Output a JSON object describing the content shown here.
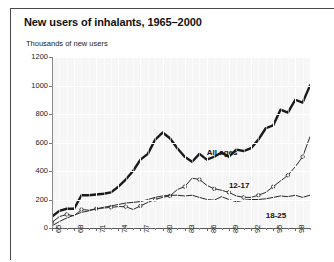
{
  "figure": {
    "title": "New users of inhalants, 1965–2000",
    "ylabel": "Thousands of new users"
  },
  "chart_data": {
    "type": "line",
    "title": "New users of inhalants, 1965–2000",
    "subtitle": "",
    "xlabel": "",
    "ylabel": "Thousands of new users",
    "ylim": [
      0,
      1200
    ],
    "yticks": [
      0,
      200,
      400,
      600,
      800,
      1000,
      1200
    ],
    "ytick_labels": [
      "0",
      "200",
      "400",
      "600",
      "800",
      "1000",
      "1200"
    ],
    "xlim": [
      1965,
      2000
    ],
    "xticks": [
      1965,
      1968,
      1971,
      1974,
      1977,
      1980,
      1983,
      1986,
      1989,
      1992,
      1995,
      1998
    ],
    "xtick_labels": [
      "65",
      "68",
      "71",
      "74",
      "77",
      "80",
      "83",
      "86",
      "89",
      "92",
      "95",
      "98"
    ],
    "grid": true,
    "grid_color": "#ffffff",
    "plot_background": "#f6f6f6",
    "legend": "inline-annotations",
    "x": [
      1965,
      1966,
      1967,
      1968,
      1969,
      1970,
      1971,
      1972,
      1973,
      1974,
      1975,
      1976,
      1977,
      1978,
      1979,
      1980,
      1981,
      1982,
      1983,
      1984,
      1985,
      1986,
      1987,
      1988,
      1989,
      1990,
      1991,
      1992,
      1993,
      1994,
      1995,
      1996,
      1997,
      1998,
      1999,
      2000
    ],
    "series": [
      {
        "name": "All ages",
        "color": "#1a1a1a",
        "width": 2.4,
        "marker": "none",
        "values": [
          80,
          120,
          135,
          135,
          230,
          230,
          235,
          240,
          250,
          290,
          340,
          400,
          480,
          520,
          620,
          670,
          630,
          560,
          500,
          465,
          520,
          480,
          500,
          530,
          500,
          550,
          540,
          560,
          620,
          700,
          720,
          830,
          810,
          900,
          880,
          1000
        ]
      },
      {
        "name": "12-17",
        "color": "#2a2a2a",
        "width": 1.0,
        "marker": "circle",
        "values": [
          40,
          80,
          95,
          85,
          130,
          125,
          135,
          140,
          145,
          150,
          150,
          130,
          155,
          180,
          200,
          215,
          225,
          270,
          290,
          350,
          340,
          300,
          275,
          265,
          250,
          225,
          215,
          215,
          230,
          250,
          290,
          330,
          370,
          430,
          500,
          640
        ]
      },
      {
        "name": "18-25",
        "color": "#2a2a2a",
        "width": 1.0,
        "marker": "none",
        "values": [
          15,
          45,
          70,
          90,
          110,
          120,
          135,
          145,
          155,
          165,
          175,
          180,
          185,
          200,
          215,
          225,
          230,
          230,
          225,
          230,
          215,
          200,
          195,
          220,
          200,
          185,
          195,
          200,
          200,
          205,
          215,
          225,
          220,
          230,
          215,
          230
        ]
      }
    ],
    "annotations": [
      {
        "text": "All ages",
        "x": 1986,
        "y": 560
      },
      {
        "text": "12-17",
        "x": 1989,
        "y": 330
      },
      {
        "text": "18-25",
        "x": 1994,
        "y": 120
      }
    ]
  }
}
